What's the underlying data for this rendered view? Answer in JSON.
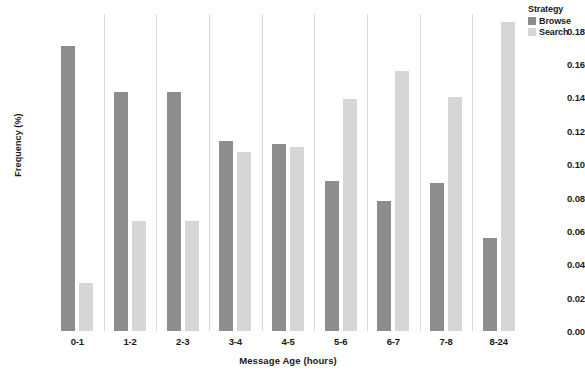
{
  "chart_data": {
    "type": "bar",
    "title": "",
    "xlabel": "Message Age (hours)",
    "ylabel": "Frequency (%)",
    "categories": [
      "0-1",
      "1-2",
      "2-3",
      "3-4",
      "4-5",
      "5-6",
      "6-7",
      "7-8",
      "8-24"
    ],
    "series": [
      {
        "name": "Browse",
        "color": "#8d8d8d",
        "values": [
          0.171,
          0.1435,
          0.1435,
          0.114,
          0.112,
          0.09,
          0.078,
          0.089,
          0.056
        ]
      },
      {
        "name": "Search",
        "color": "#d6d6d6",
        "values": [
          0.029,
          0.066,
          0.066,
          0.107,
          0.11,
          0.139,
          0.156,
          0.14,
          0.185
        ]
      }
    ],
    "ylim": [
      0.0,
      0.19
    ],
    "yticks": [
      "0.00",
      "0.02",
      "0.04",
      "0.06",
      "0.08",
      "0.10",
      "0.12",
      "0.14",
      "0.16",
      "0.18"
    ],
    "ytick_values": [
      0.0,
      0.02,
      0.04,
      0.06,
      0.08,
      0.1,
      0.12,
      0.14,
      0.16,
      0.18
    ],
    "grid": "vertical-only",
    "legend": {
      "title": "Strategy",
      "position": "top-right-outside",
      "entries": [
        "Browse",
        "Search"
      ]
    }
  }
}
